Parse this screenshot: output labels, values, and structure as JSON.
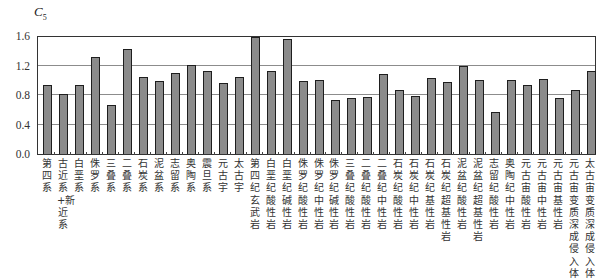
{
  "chart_data": {
    "type": "bar",
    "title": "",
    "xlabel": "",
    "ylabel": "C5",
    "ylabel_main": "C",
    "ylabel_sub": "5",
    "ylim": [
      0.0,
      1.6
    ],
    "yticks": [
      "0.0",
      "0.4",
      "0.8",
      "1.2",
      "1.6"
    ],
    "grid": true,
    "legend": null,
    "colors": {
      "bar_fill": "#8b8b8b",
      "bar_edge": "#1e1e1e",
      "grid": "#8c8c8c",
      "frame": "#333333"
    },
    "categories": [
      "第四系",
      "古近系+新近系",
      "白垩系",
      "侏罗系",
      "三叠系",
      "二叠系",
      "石炭系",
      "泥盆系",
      "志留系",
      "奥陶系",
      "震旦系",
      "元古宇",
      "太古宇",
      "第四纪玄武岩",
      "白垩纪酸性岩",
      "白垩纪碱性岩",
      "侏罗纪酸性岩",
      "侏罗纪中性岩",
      "侏罗纪碱性岩",
      "三叠纪酸性岩",
      "二叠纪酸性岩",
      "二叠纪中性岩",
      "石炭纪酸性岩",
      "石炭纪中性岩",
      "石炭纪基性岩",
      "石炭纪超基性岩",
      "泥盆纪酸性岩",
      "泥盆纪超基性岩",
      "志留纪酸性岩",
      "奥陶纪中性岩",
      "元古宙酸性岩",
      "元古宙中性岩",
      "元古宙基性岩",
      "元古宙变质深成侵入体",
      "太古宙变质深成侵入体"
    ],
    "values": [
      0.93,
      0.82,
      0.93,
      1.31,
      0.67,
      1.42,
      1.04,
      0.99,
      1.1,
      1.21,
      1.13,
      0.96,
      1.05,
      1.58,
      1.12,
      1.56,
      0.99,
      1.01,
      0.73,
      0.76,
      0.77,
      1.09,
      0.87,
      0.78,
      1.03,
      0.97,
      1.19,
      1.01,
      0.57,
      1.01,
      0.94,
      1.02,
      0.76,
      0.87,
      1.12
    ]
  }
}
